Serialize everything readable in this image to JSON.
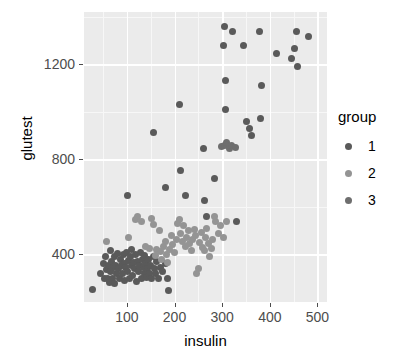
{
  "chart_data": {
    "type": "scatter",
    "title": "",
    "xlabel": "insulin",
    "ylabel": "glutest",
    "xlim": [
      10,
      520
    ],
    "ylim": [
      200,
      1420
    ],
    "xticks": [
      100,
      200,
      300,
      400,
      500
    ],
    "yticks": [
      400,
      800,
      1200
    ],
    "xtick_labels": [
      "100",
      "200",
      "300",
      "400",
      "500"
    ],
    "ytick_labels": [
      "400",
      "800",
      "1200"
    ],
    "grid": true,
    "panel_background": "#ebebeb",
    "gridline_color": "#ffffff",
    "legend": {
      "title": "group",
      "position": "right",
      "entries": [
        {
          "label": "1",
          "color": "#5a5a5a"
        },
        {
          "label": "2",
          "color": "#949494"
        },
        {
          "label": "3",
          "color": "#6e6e6e"
        }
      ]
    },
    "series": [
      {
        "name": "1",
        "color": "#5a5a5a",
        "points": [
          [
            27,
            253
          ],
          [
            45,
            322
          ],
          [
            50,
            360
          ],
          [
            52,
            300
          ],
          [
            55,
            392
          ],
          [
            58,
            337
          ],
          [
            60,
            300
          ],
          [
            61,
            355
          ],
          [
            63,
            281
          ],
          [
            65,
            418
          ],
          [
            66,
            330
          ],
          [
            68,
            372
          ],
          [
            70,
            300
          ],
          [
            71,
            345
          ],
          [
            73,
            392
          ],
          [
            75,
            278
          ],
          [
            77,
            355
          ],
          [
            79,
            318
          ],
          [
            80,
            404
          ],
          [
            82,
            340
          ],
          [
            84,
            300
          ],
          [
            86,
            378
          ],
          [
            88,
            355
          ],
          [
            90,
            320
          ],
          [
            92,
            400
          ],
          [
            94,
            362
          ],
          [
            95,
            290
          ],
          [
            97,
            345
          ],
          [
            99,
            410
          ],
          [
            101,
            330
          ],
          [
            103,
            375
          ],
          [
            105,
            300
          ],
          [
            107,
            392
          ],
          [
            109,
            352
          ],
          [
            110,
            420
          ],
          [
            112,
            310
          ],
          [
            114,
            365
          ],
          [
            116,
            340
          ],
          [
            118,
            400
          ],
          [
            120,
            288
          ],
          [
            122,
            372
          ],
          [
            124,
            330
          ],
          [
            126,
            355
          ],
          [
            128,
            410
          ],
          [
            130,
            300
          ],
          [
            132,
            380
          ],
          [
            134,
            345
          ],
          [
            136,
            318
          ],
          [
            138,
            395
          ],
          [
            140,
            360
          ],
          [
            142,
            302
          ],
          [
            144,
            340
          ],
          [
            146,
            378
          ],
          [
            148,
            322
          ],
          [
            150,
            355
          ],
          [
            152,
            300
          ],
          [
            155,
            390
          ],
          [
            158,
            340
          ],
          [
            160,
            318
          ],
          [
            163,
            370
          ],
          [
            166,
            300
          ],
          [
            170,
            345
          ],
          [
            175,
            330
          ],
          [
            180,
            360
          ],
          [
            185,
            300
          ],
          [
            188,
            250
          ],
          [
            102,
            650
          ],
          [
            155,
            915
          ],
          [
            180,
            680
          ],
          [
            210,
            1030
          ],
          [
            213,
            755
          ],
          [
            222,
            650
          ],
          [
            260,
            845
          ],
          [
            262,
            625
          ],
          [
            268,
            560
          ],
          [
            283,
            720
          ],
          [
            305,
            1360
          ],
          [
            303,
            1280
          ],
          [
            307,
            1130
          ],
          [
            308,
            1010
          ],
          [
            322,
            1340
          ],
          [
            330,
            540
          ],
          [
            345,
            1280
          ],
          [
            352,
            960
          ],
          [
            358,
            930
          ],
          [
            362,
            900
          ],
          [
            378,
            1340
          ],
          [
            380,
            970
          ],
          [
            383,
            1110
          ],
          [
            415,
            1245
          ],
          [
            445,
            1225
          ],
          [
            452,
            1265
          ],
          [
            457,
            1340
          ],
          [
            458,
            1190
          ],
          [
            482,
            1315
          ]
        ]
      },
      {
        "name": "2",
        "color": "#949494",
        "points": [
          [
            58,
            455
          ],
          [
            103,
            470
          ],
          [
            118,
            545
          ],
          [
            122,
            560
          ],
          [
            130,
            540
          ],
          [
            140,
            435
          ],
          [
            148,
            425
          ],
          [
            152,
            550
          ],
          [
            155,
            528
          ],
          [
            160,
            395
          ],
          [
            163,
            420
          ],
          [
            168,
            500
          ],
          [
            170,
            412
          ],
          [
            173,
            380
          ],
          [
            176,
            432
          ],
          [
            180,
            455
          ],
          [
            183,
            398
          ],
          [
            186,
            368
          ],
          [
            190,
            420
          ],
          [
            193,
            480
          ],
          [
            196,
            440
          ],
          [
            200,
            410
          ],
          [
            204,
            465
          ],
          [
            207,
            530
          ],
          [
            210,
            545
          ],
          [
            213,
            490
          ],
          [
            216,
            455
          ],
          [
            219,
            520
          ],
          [
            222,
            432
          ],
          [
            226,
            470
          ],
          [
            229,
            500
          ],
          [
            232,
            448
          ],
          [
            235,
            415
          ],
          [
            238,
            465
          ],
          [
            241,
            505
          ],
          [
            244,
            480
          ],
          [
            247,
            322
          ],
          [
            250,
            340
          ],
          [
            253,
            450
          ],
          [
            256,
            492
          ],
          [
            259,
            430
          ],
          [
            262,
            415
          ],
          [
            265,
            470
          ],
          [
            268,
            508
          ],
          [
            271,
            445
          ],
          [
            274,
            390
          ],
          [
            277,
            425
          ],
          [
            280,
            465
          ],
          [
            283,
            560
          ],
          [
            287,
            540
          ],
          [
            292,
            490
          ],
          [
            297,
            520
          ],
          [
            302,
            470
          ],
          [
            310,
            540
          ]
        ]
      },
      {
        "name": "3",
        "color": "#6e6e6e",
        "points": [
          [
            298,
            855
          ],
          [
            305,
            860
          ],
          [
            310,
            870
          ],
          [
            315,
            845
          ],
          [
            320,
            860
          ],
          [
            327,
            850
          ]
        ]
      }
    ]
  },
  "axes": {
    "y_title": "glutest",
    "x_title": "insulin"
  }
}
